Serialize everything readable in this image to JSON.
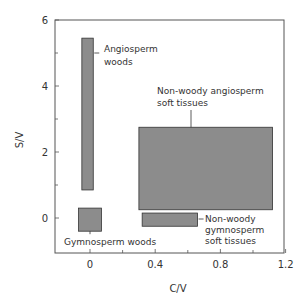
{
  "chart_data": {
    "type": "range-rectangles",
    "title": "",
    "xlabel": "C/V",
    "ylabel": "S/V",
    "xlim": [
      -0.22,
      1.2
    ],
    "ylim": [
      -1.1,
      6
    ],
    "xticks": [
      0,
      0.4,
      0.8,
      1.2
    ],
    "xtick_labels": [
      "0",
      "0.4",
      "0.8",
      "1.2"
    ],
    "xminor_ticks": [
      0.2,
      0.6,
      1.0
    ],
    "yticks": [
      0,
      2,
      4,
      6
    ],
    "ytick_labels": [
      "0",
      "2",
      "4",
      "6"
    ],
    "yminor_ticks": [
      1,
      3,
      5
    ],
    "grid": false,
    "legend": null,
    "fill_color": "#8c8c8c",
    "edge_color": "#333333",
    "series": [
      {
        "name": "Angiosperm woods",
        "label_lines": [
          "Angiosperm",
          "woods"
        ],
        "x_range": [
          -0.05,
          0.02
        ],
        "y_range": [
          0.85,
          5.45
        ]
      },
      {
        "name": "Gymnosperm woods",
        "label_lines": [
          "Gymnosperm woods"
        ],
        "x_range": [
          -0.07,
          0.07
        ],
        "y_range": [
          -0.4,
          0.3
        ]
      },
      {
        "name": "Non-woody angiosperm soft tissues",
        "label_lines": [
          "Non-woody angiosperm",
          "soft tissues"
        ],
        "x_range": [
          0.3,
          1.12
        ],
        "y_range": [
          0.25,
          2.75
        ]
      },
      {
        "name": "Non-woody gymnosperm soft tissues",
        "label_lines": [
          "Non-woody",
          "gymnosperm",
          "soft tissues"
        ],
        "x_range": [
          0.32,
          0.66
        ],
        "y_range": [
          -0.25,
          0.15
        ]
      }
    ]
  }
}
